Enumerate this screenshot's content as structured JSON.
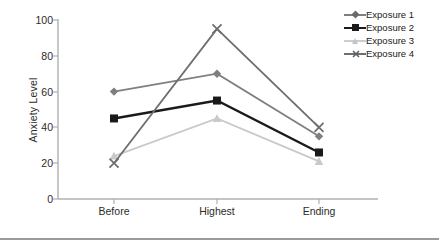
{
  "chart_data": {
    "type": "line",
    "title": "",
    "xlabel": "",
    "ylabel": "Anxiety Level",
    "categories": [
      "Before",
      "Highest",
      "Ending"
    ],
    "ylim": [
      0,
      100
    ],
    "yticks": [
      "0",
      "20",
      "40",
      "60",
      "80",
      "100"
    ],
    "grid": false,
    "legend_position": "right",
    "series": [
      {
        "name": "Exposure 1",
        "values": [
          60,
          70,
          35
        ],
        "color": "#7f7f7f",
        "marker": "diamond"
      },
      {
        "name": "Exposure 2",
        "values": [
          45,
          55,
          26
        ],
        "color": "#1a1a1a",
        "marker": "square"
      },
      {
        "name": "Exposure 3",
        "values": [
          24,
          45,
          21
        ],
        "color": "#c9c9c9",
        "marker": "triangle"
      },
      {
        "name": "Exposure 4",
        "values": [
          20,
          95,
          40
        ],
        "color": "#6e6e6e",
        "marker": "cross"
      }
    ]
  },
  "axes": {
    "y_title": "Anxiety Level",
    "y_ticks": [
      {
        "label": "100",
        "value": 100
      },
      {
        "label": "80",
        "value": 80
      },
      {
        "label": "60",
        "value": 60
      },
      {
        "label": "40",
        "value": 40
      },
      {
        "label": "20",
        "value": 20
      },
      {
        "label": "0",
        "value": 0
      }
    ],
    "x_ticks": [
      {
        "label": "Before"
      },
      {
        "label": "Highest"
      },
      {
        "label": "Ending"
      }
    ]
  },
  "legend": {
    "entries": [
      {
        "label": "Exposure 1"
      },
      {
        "label": "Exposure 2"
      },
      {
        "label": "Exposure 3"
      },
      {
        "label": "Exposure 4"
      }
    ]
  },
  "colors": {
    "axis": "#b0b0b0",
    "text": "#2b2b2b",
    "footer_rule": "#9a9a9a"
  }
}
